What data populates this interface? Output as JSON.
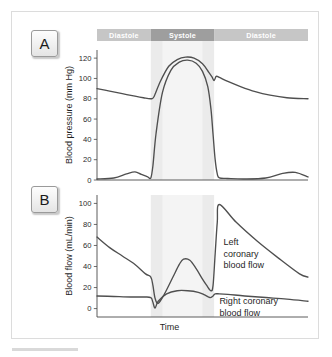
{
  "figure": {
    "panels": [
      {
        "badge": "A"
      },
      {
        "badge": "B"
      }
    ]
  },
  "phase_bar": {
    "segments": [
      {
        "label": "Diastole",
        "tone": "light"
      },
      {
        "label": "Systole",
        "tone": "dark"
      },
      {
        "label": "Diastole",
        "tone": "light"
      }
    ]
  },
  "colors": {
    "phase_light": "#c6c6c6",
    "phase_dark": "#9e9e9e",
    "systole_band": "#ebebeb",
    "systole_core": "#f4f4f4",
    "curve": "#4f4f4f",
    "axis": "#4a4a4a",
    "frame": "#dcdcdc",
    "text": "#1f1f1f"
  },
  "chart_data": [
    {
      "type": "line",
      "panel": "A",
      "title": "Blood pressure during the cardiac cycle",
      "xlabel": "Time",
      "ylabel": "Blood pressure (mm Hg)",
      "ylim": [
        0,
        128
      ],
      "yticks": [
        0,
        20,
        40,
        60,
        80,
        100,
        120
      ],
      "xlim": [
        0,
        100
      ],
      "grid": false,
      "legend": "none",
      "shaded_regions": [
        {
          "name": "systole",
          "x0": 25.5,
          "x1": 55.5,
          "label": "Systole"
        },
        {
          "name": "systole-core",
          "x0": 31.0,
          "x1": 50.0
        }
      ],
      "series": [
        {
          "name": "Aortic pressure",
          "x": [
            0,
            6,
            12,
            18,
            22,
            25.5,
            27,
            30,
            34,
            38,
            42,
            46,
            50,
            53,
            54.5,
            55.5,
            56.5,
            58,
            62,
            68,
            75,
            82,
            90,
            100
          ],
          "values": [
            90,
            87.5,
            85,
            82.5,
            81,
            80,
            82,
            97,
            112,
            118.5,
            121,
            120,
            114.5,
            106,
            101.5,
            98,
            102,
            101,
            97,
            92,
            87,
            83.5,
            81,
            80
          ]
        },
        {
          "name": "Left ventricular pressure",
          "x": [
            0,
            8,
            14,
            18,
            21,
            24,
            25.5,
            26.5,
            28,
            31,
            35,
            39,
            43,
            47,
            50,
            52.5,
            54,
            55,
            56,
            57,
            58,
            62,
            70,
            80,
            88,
            94,
            100
          ],
          "values": [
            1,
            2,
            6,
            8,
            5.5,
            3,
            2,
            14,
            46,
            86,
            108,
            116,
            118,
            115,
            107,
            92,
            70,
            45,
            20,
            6,
            2,
            1.5,
            1,
            2,
            6.5,
            7.5,
            3
          ]
        }
      ]
    },
    {
      "type": "line",
      "panel": "B",
      "title": "Coronary blood flow during the cardiac cycle",
      "xlabel": "Time",
      "ylabel": "Blood flow (mL/min)",
      "ylim": [
        -8,
        108
      ],
      "yticks": [
        0,
        20,
        40,
        60,
        80,
        100
      ],
      "xlim": [
        0,
        100
      ],
      "grid": false,
      "legend": "inline-annotations",
      "shaded_regions": [
        {
          "name": "systole",
          "x0": 25.5,
          "x1": 55.5,
          "label": "Systole"
        },
        {
          "name": "systole-core",
          "x0": 31.0,
          "x1": 50.0
        }
      ],
      "annotations": [
        {
          "text": "Left coronary blood flow",
          "lines": [
            "Left",
            "coronary",
            "blood flow"
          ],
          "x": 60,
          "y": 60
        },
        {
          "text": "Right coronary blood flow",
          "lines": [
            "Right coronary",
            "blood flow"
          ],
          "x": 58,
          "y": 4
        }
      ],
      "series": [
        {
          "name": "Left coronary blood flow",
          "x": [
            0,
            6,
            12,
            18,
            23,
            25.5,
            26.5,
            27.5,
            29,
            32,
            36,
            39,
            41,
            44,
            47,
            50,
            52,
            54,
            55,
            56,
            57,
            58,
            66,
            76,
            86,
            96,
            100
          ],
          "values": [
            68,
            58,
            50,
            42,
            33,
            30,
            22,
            10,
            5,
            14,
            30,
            42,
            47,
            46,
            38,
            28,
            22,
            17,
            22,
            52,
            82,
            99,
            82,
            64,
            48,
            33,
            30
          ]
        },
        {
          "name": "Right coronary blood flow",
          "x": [
            0,
            8,
            16,
            22,
            25.5,
            26.5,
            27.5,
            29,
            33,
            38,
            43,
            48,
            51,
            53.5,
            55,
            56,
            58,
            62,
            70,
            80,
            90,
            100
          ],
          "values": [
            12,
            11.5,
            11,
            11,
            10.5,
            6,
            0.5,
            7,
            14,
            17,
            17,
            15.5,
            13,
            10.5,
            12,
            14,
            14,
            13.5,
            12,
            10.5,
            9,
            7
          ]
        }
      ]
    }
  ]
}
